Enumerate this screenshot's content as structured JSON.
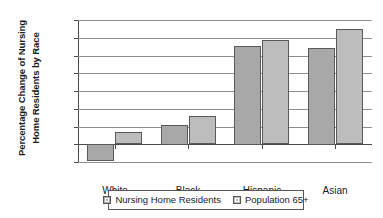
{
  "chart_data": {
    "type": "bar",
    "title": "",
    "xlabel": "",
    "ylabel_line1": "Percentage Change of Nursing",
    "ylabel_line2": "Home Residents by Race",
    "categories": [
      "White",
      "Black",
      "Hispanic",
      "Asian"
    ],
    "series": [
      {
        "name": "Nursing Home Residents",
        "values": [
          -9.5,
          11.0,
          55.5,
          54.5
        ],
        "color": "#a8a8a8"
      },
      {
        "name": "Population 65+",
        "values": [
          6.8,
          16.0,
          58.5,
          65.0
        ],
        "color": "#bdbdbd"
      }
    ],
    "ylim": [
      -10,
      70
    ],
    "ytick_values": [
      70,
      60,
      50,
      40,
      30,
      20,
      10,
      0,
      -10
    ],
    "ytick_labels": [
      "70.0%",
      "60.0%",
      "50.0%",
      "40.0%",
      "30.0%",
      "20.0%",
      "10.0%",
      "0.0%",
      "-10.0%"
    ],
    "grid": true,
    "legend_position": "bottom",
    "legend_entries": [
      "Nursing Home Residents",
      "Population 65+"
    ]
  }
}
